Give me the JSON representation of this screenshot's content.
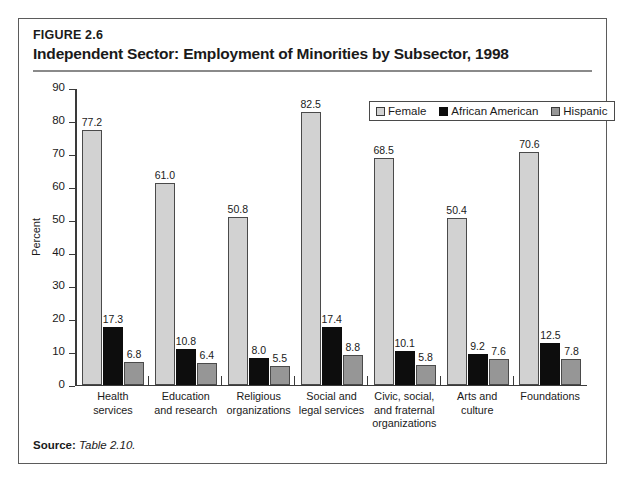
{
  "figure": {
    "number": "FIGURE 2.6",
    "title": "Independent Sector: Employment of Minorities by Subsector, 1998",
    "source_label": "Source:",
    "source_value": "Table 2.10."
  },
  "colors": {
    "female": "#d2d2d2",
    "african_american": "#0d0d0d",
    "hispanic": "#969696",
    "axis": "#3a3a3a",
    "frame": "#5b5b5b"
  },
  "chart_data": {
    "type": "bar",
    "title": "Independent Sector: Employment of Minorities by Subsector, 1998",
    "xlabel": "",
    "ylabel": "Percent",
    "ylim": [
      0,
      90
    ],
    "yticks": [
      0,
      10,
      20,
      30,
      40,
      50,
      60,
      70,
      80,
      90
    ],
    "grid": false,
    "legend_position": "top-right",
    "categories": [
      "Health services",
      "Education and research",
      "Religious organizations",
      "Social and legal services",
      "Civic, social, and fraternal organizations",
      "Arts and culture",
      "Foundations"
    ],
    "category_lines": [
      [
        "Health",
        "services"
      ],
      [
        "Education",
        "and research"
      ],
      [
        "Religious",
        "organizations"
      ],
      [
        "Social and",
        "legal services"
      ],
      [
        "Civic, social,",
        "and fraternal",
        "organizations"
      ],
      [
        "Arts and",
        "culture"
      ],
      [
        "Foundations"
      ]
    ],
    "series": [
      {
        "name": "Female",
        "color": "#d2d2d2",
        "values": [
          77.2,
          61.0,
          50.8,
          82.5,
          68.5,
          50.4,
          70.6
        ],
        "labels": [
          "77.2",
          "61.0",
          "50.8",
          "82.5",
          "68.5",
          "50.4",
          "70.6"
        ]
      },
      {
        "name": "African American",
        "color": "#0d0d0d",
        "values": [
          17.3,
          10.8,
          8.0,
          17.4,
          10.1,
          9.2,
          12.5
        ],
        "labels": [
          "17.3",
          "10.8",
          "8.0",
          "17.4",
          "10.1",
          "9.2",
          "12.5"
        ]
      },
      {
        "name": "Hispanic",
        "color": "#969696",
        "values": [
          6.8,
          6.4,
          5.5,
          8.8,
          5.8,
          7.6,
          7.8
        ],
        "labels": [
          "6.8",
          "6.4",
          "5.5",
          "8.8",
          "5.8",
          "7.6",
          "7.8"
        ]
      }
    ]
  }
}
